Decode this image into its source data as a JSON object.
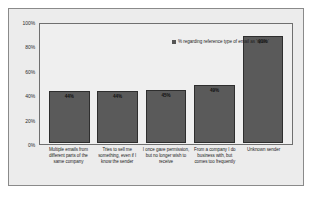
{
  "chart_data": {
    "type": "bar",
    "title": "",
    "subtitle": "",
    "xlabel": "",
    "ylabel": "",
    "ylim": [
      0,
      100
    ],
    "grid": false,
    "legend_position": "top-right",
    "legend": [
      "% regarding reference type of email as 'spam'"
    ],
    "ytick_labels": [
      "100%",
      "80%",
      "60%",
      "40%",
      "20%",
      "0%"
    ],
    "ytick_values": [
      100,
      80,
      60,
      40,
      20,
      0
    ],
    "categories": [
      "Multiple emails from different parts of the same company",
      "Tries to sell me something, even if I know the sender",
      "I once gave permission, but no longer wish to receive",
      "From a company I do business with, but comes too frequently",
      "Unknown sender"
    ],
    "values": [
      44,
      44,
      45,
      49,
      91
    ],
    "value_labels": [
      "44%",
      "44%",
      "45%",
      "49%",
      "91%"
    ],
    "series": [
      {
        "name": "% regarding reference type of email as 'spam'",
        "values": [
          44,
          44,
          45,
          49,
          91
        ]
      }
    ],
    "colors": {
      "bar_fill": "#5a5a5a",
      "bar_border": "#2e2e2e",
      "figure_background": "#ececec",
      "plot_background": "#efefef",
      "frame_border": "#8a8a8a",
      "axis_border": "#6f6f6f",
      "text": "#1c1c1c"
    }
  },
  "legend": {
    "marker_icon": "legend-square-icon",
    "label": "% regarding reference type of email as 'spam'"
  },
  "y_axis": {
    "ticks": [
      "100%",
      "80%",
      "60%",
      "40%",
      "20%",
      "0%"
    ]
  },
  "x_axis": {
    "categories": [
      "Multiple emails from different parts of the same company",
      "Tries to sell me something, even if I know the sender",
      "I once gave permission, but no longer wish to receive",
      "From a company I do business with, but comes too frequently",
      "Unknown sender"
    ]
  },
  "bars": [
    {
      "label": "44%",
      "value": 44
    },
    {
      "label": "44%",
      "value": 44
    },
    {
      "label": "45%",
      "value": 45
    },
    {
      "label": "49%",
      "value": 49
    },
    {
      "label": "91%",
      "value": 91
    }
  ]
}
